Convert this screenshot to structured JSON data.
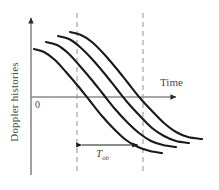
{
  "figure": {
    "background_color": "#ffffff",
    "axis_color": "#8a8a8a",
    "curve_color": "#1a1a1a",
    "dashed_color": "#999999",
    "text_color": "#4a4a4a"
  },
  "labels": {
    "y_axis": "Doppler histories",
    "x_axis": "Time",
    "origin": "0",
    "interval_symbol": "T",
    "interval_subscript": "ob"
  },
  "icons": {
    "y_axis_arrow": "arrow-up-icon",
    "x_axis_arrow": "arrow-right-icon",
    "interval_arrow_left": "arrow-left-icon",
    "interval_arrow_right": "arrow-right-icon"
  },
  "chart_data": {
    "type": "line",
    "title": "",
    "xlabel": "Time",
    "ylabel": "Doppler histories",
    "grid": false,
    "legend": false,
    "axes": {
      "origin_px": [
        31,
        97
      ],
      "x_axis_from_px": [
        31,
        97
      ],
      "x_axis_to_px": [
        182,
        97
      ],
      "y_axis_from_px": [
        31,
        175
      ],
      "y_axis_to_px": [
        31,
        15
      ],
      "origin_tick_label": "0"
    },
    "annotations": [
      {
        "name": "observation-interval",
        "label": "T_ob",
        "type": "double-arrow",
        "x_start_px": 77,
        "x_end_px": 143,
        "y_px": 145
      },
      {
        "name": "dashed-marker-left",
        "type": "vertical-dashed-line",
        "x_px": 77,
        "y_top_px": 13,
        "y_bottom_px": 174
      },
      {
        "name": "dashed-marker-right",
        "type": "vertical-dashed-line",
        "x_px": 143,
        "y_top_px": 13,
        "y_bottom_px": 174
      }
    ],
    "series": [
      {
        "name": "doppler-history-1",
        "points_px": [
          [
            34,
            49
          ],
          [
            44,
            52
          ],
          [
            55,
            60
          ],
          [
            66,
            72
          ],
          [
            78,
            86
          ],
          [
            90,
            101
          ],
          [
            102,
            116
          ],
          [
            114,
            129
          ],
          [
            126,
            140
          ],
          [
            138,
            147
          ],
          [
            150,
            151
          ],
          [
            162,
            153
          ]
        ]
      },
      {
        "name": "doppler-history-2",
        "points_px": [
          [
            46,
            42
          ],
          [
            57,
            45
          ],
          [
            68,
            53
          ],
          [
            79,
            65
          ],
          [
            91,
            79
          ],
          [
            103,
            94
          ],
          [
            115,
            109
          ],
          [
            127,
            122
          ],
          [
            139,
            133
          ],
          [
            151,
            141
          ],
          [
            163,
            145
          ],
          [
            176,
            147
          ]
        ]
      },
      {
        "name": "doppler-history-3",
        "points_px": [
          [
            58,
            36
          ],
          [
            69,
            39
          ],
          [
            80,
            47
          ],
          [
            92,
            59
          ],
          [
            104,
            73
          ],
          [
            116,
            88
          ],
          [
            128,
            103
          ],
          [
            140,
            116
          ],
          [
            152,
            128
          ],
          [
            164,
            136
          ],
          [
            176,
            141
          ],
          [
            189,
            143
          ]
        ]
      },
      {
        "name": "doppler-history-4",
        "points_px": [
          [
            70,
            32
          ],
          [
            81,
            35
          ],
          [
            92,
            42
          ],
          [
            104,
            54
          ],
          [
            116,
            68
          ],
          [
            128,
            83
          ],
          [
            140,
            98
          ],
          [
            152,
            111
          ],
          [
            164,
            123
          ],
          [
            176,
            132
          ],
          [
            188,
            137
          ],
          [
            202,
            139
          ]
        ]
      }
    ]
  }
}
